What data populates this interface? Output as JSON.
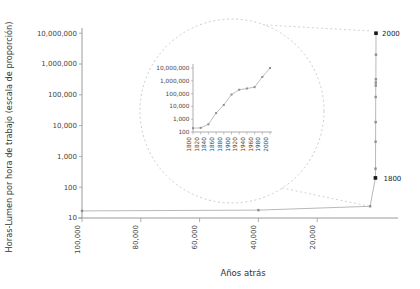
{
  "figure": {
    "y_axis_title": "Horas-Lumen por hora de trabajo (escala de proporción)",
    "x_axis_title": "Años atrás",
    "label_2000": "2000",
    "label_1800": "1800"
  },
  "colors": {
    "line": "#b9b9b9",
    "marker": "#8f8f8f",
    "labeled_point": "#1a1a1a",
    "axis": "#9a9a9a",
    "tick_text": "#444444",
    "title_text": "#333333",
    "callout": "#cccccc",
    "background": "#ffffff"
  },
  "chart_data": [
    {
      "id": "main",
      "type": "line",
      "xlabel": "Años atrás",
      "ylabel": "Horas-Lumen por hora de trabajo (escala de proporción)",
      "y_scale": "log",
      "ylim": [
        10,
        10000000
      ],
      "x_axis_reversed": true,
      "xlim_years_ago": [
        100000,
        0
      ],
      "x_ticks": [
        {
          "value": 100000,
          "label": "100,000"
        },
        {
          "value": 80000,
          "label": "80,000"
        },
        {
          "value": 60000,
          "label": "60,000"
        },
        {
          "value": 40000,
          "label": "40,000"
        },
        {
          "value": 20000,
          "label": "20,000"
        }
      ],
      "y_ticks": [
        {
          "value": 10,
          "label": "10"
        },
        {
          "value": 100,
          "label": "100"
        },
        {
          "value": 1000,
          "label": "1,000"
        },
        {
          "value": 10000,
          "label": "10,000"
        },
        {
          "value": 100000,
          "label": "100,000"
        },
        {
          "value": 1000000,
          "label": "1,000,000"
        },
        {
          "value": 10000000,
          "label": "10,000,000"
        }
      ],
      "prehistoric_points": [
        {
          "years_ago": 100000,
          "value": 17
        },
        {
          "years_ago": 40000,
          "value": 18
        },
        {
          "years_ago": 2000,
          "value": 24
        }
      ],
      "modern_years": [
        1800,
        1820,
        1840,
        1860,
        1880,
        1900,
        1920,
        1940,
        1960,
        1980,
        2000
      ],
      "modern_values": [
        200,
        210,
        400,
        3000,
        13000,
        85000,
        200000,
        250000,
        320000,
        2000000,
        10000000
      ],
      "labeled_points": [
        {
          "label": "2000",
          "year": 2000,
          "value": 10000000
        },
        {
          "label": "1800",
          "year": 1800,
          "value": 200
        }
      ]
    },
    {
      "id": "inset",
      "type": "line",
      "y_scale": "log",
      "ylim": [
        100,
        10000000
      ],
      "x": [
        1800,
        1820,
        1840,
        1860,
        1880,
        1900,
        1920,
        1940,
        1960,
        1980,
        2000
      ],
      "values": [
        200,
        210,
        400,
        3000,
        13000,
        85000,
        200000,
        250000,
        320000,
        2000000,
        10000000
      ],
      "x_tick_labels": [
        "1800",
        "1820",
        "1840",
        "1860",
        "1880",
        "1900",
        "1920",
        "1940",
        "1960",
        "1980",
        "2000"
      ],
      "y_ticks": [
        {
          "value": 100,
          "label": "100"
        },
        {
          "value": 1000,
          "label": "1,000"
        },
        {
          "value": 10000,
          "label": "10,000"
        },
        {
          "value": 100000,
          "label": "100,000"
        },
        {
          "value": 1000000,
          "label": "1,000,000"
        },
        {
          "value": 10000000,
          "label": "10,000,000"
        }
      ]
    }
  ]
}
